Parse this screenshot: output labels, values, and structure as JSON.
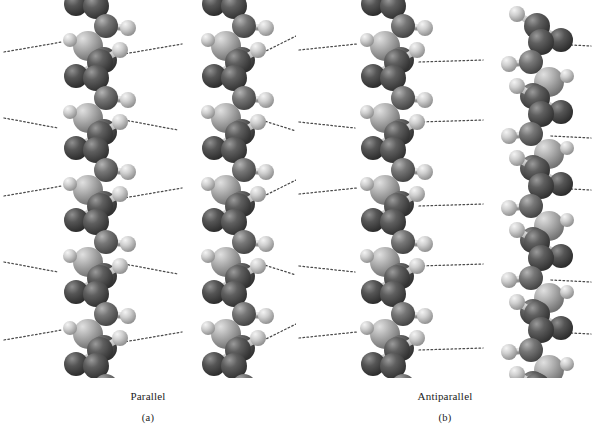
{
  "figure": {
    "background_color": "#ffffff",
    "width": 593,
    "height": 440
  },
  "panels": [
    {
      "id": "a",
      "name_label": "Parallel",
      "index_label": "(a)",
      "chain_orientation": "same-direction",
      "chains": 2,
      "hbond_rows": 5
    },
    {
      "id": "b",
      "name_label": "Antiparallel",
      "index_label": "(b)",
      "chain_orientation": "opposite-direction",
      "chains": 2,
      "hbond_rows": 5
    }
  ],
  "atoms": {
    "legend": [
      {
        "role": "nitrogen-carbonyl-atom",
        "color": "#5a5a5a",
        "radius": 13
      },
      {
        "role": "alpha-carbon-atom",
        "color": "#6e6e6e",
        "radius": 12
      },
      {
        "role": "oxygen-atom",
        "color": "#4f4f4f",
        "radius": 12
      },
      {
        "role": "hydrogen-atom",
        "color": "#c8c8c8",
        "radius": 8
      },
      {
        "role": "r-group-atom",
        "color": "#a9a9a9",
        "radius": 15
      }
    ],
    "bond_color": "#bdbdbd",
    "hydrogen_bond_color": "#4a4a4a",
    "hydrogen_bond_style": "dotted"
  },
  "geometry": {
    "repeat_height": 72,
    "repeat_count": 5,
    "hbond_row_y": [
      48,
      120,
      192,
      264,
      336
    ],
    "chain_x_panel_a": [
      90,
      228
    ],
    "chain_x_panel_b": [
      90,
      228
    ]
  }
}
